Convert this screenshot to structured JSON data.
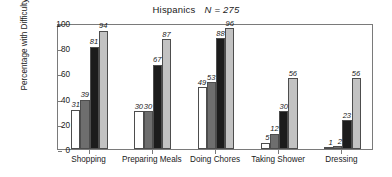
{
  "chart_data": {
    "type": "bar",
    "title_main": "Hispanics",
    "title_n": "N = 275",
    "xlabel": "",
    "ylabel": "Percentage with Difficulty",
    "ylim": [
      0,
      100
    ],
    "yticks": [
      0,
      20,
      40,
      60,
      80,
      100
    ],
    "grid": false,
    "legend": "none",
    "categories": [
      "Shopping",
      "Preparing Meals",
      "Doing Chores",
      "Taking Shower",
      "Dressing"
    ],
    "series": [
      {
        "name": "series-1",
        "color": "#ffffff",
        "values": [
          31,
          30,
          49,
          5,
          1
        ]
      },
      {
        "name": "series-2",
        "color": "#6e6e6e",
        "values": [
          39,
          30,
          53,
          12,
          2
        ]
      },
      {
        "name": "series-3",
        "color": "#1c1c1c",
        "values": [
          81,
          67,
          88,
          30,
          23
        ]
      },
      {
        "name": "series-4",
        "color": "#c2c2c2",
        "values": [
          94,
          87,
          96,
          56,
          56
        ]
      }
    ],
    "value_labels": [
      [
        "31",
        "39",
        "81",
        "94"
      ],
      [
        "30",
        "30",
        "67",
        "87"
      ],
      [
        "49",
        "53",
        "88",
        "96"
      ],
      [
        "5",
        "12",
        "30",
        "56"
      ],
      [
        "1",
        "2",
        "23",
        "56"
      ]
    ]
  },
  "axis": {
    "y_tick_labels": [
      "100",
      "80",
      "60",
      "40",
      "20",
      "0"
    ]
  }
}
